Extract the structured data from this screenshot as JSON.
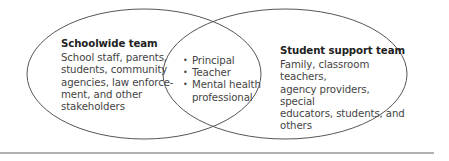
{
  "diagram": {
    "type": "venn",
    "left_set": {
      "title": "Schoolwide team",
      "description": "School staff, parents,\nstudents, community\nagencies, law enforce-\nment, and other\nstakeholders"
    },
    "right_set": {
      "title": "Student support team",
      "description": "Family, classroom teachers,\nagency providers, special\neducators, students, and\nothers"
    },
    "intersection": {
      "items": [
        "Principal",
        "Teacher",
        "Mental health\nprofessional"
      ]
    },
    "colors": {
      "stroke": "#555555",
      "rule": "#666666",
      "text": "#444444",
      "title": "#222222"
    }
  }
}
